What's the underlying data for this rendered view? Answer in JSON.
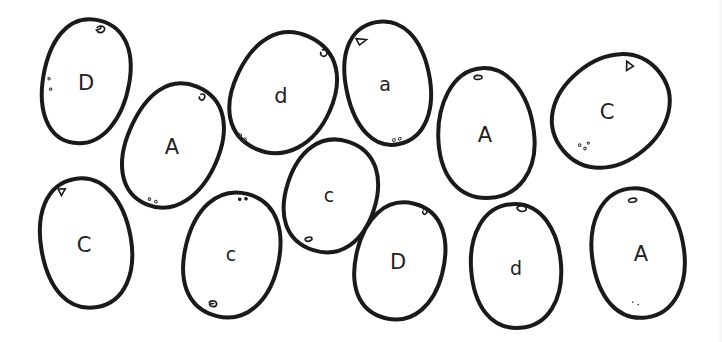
{
  "worksheet": {
    "title": "",
    "background_color": "#ffffff",
    "outline_color": "#1a1a1a",
    "potatoes": [
      {
        "letter": "D",
        "case": "upper",
        "cx": 86,
        "cy": 82,
        "rx": 43,
        "ry": 63,
        "rotate": 8
      },
      {
        "letter": "A",
        "case": "upper",
        "cx": 173,
        "cy": 146,
        "rx": 46,
        "ry": 64,
        "rotate": 22
      },
      {
        "letter": "d",
        "case": "lower",
        "cx": 283,
        "cy": 93,
        "rx": 50,
        "ry": 62,
        "rotate": 24
      },
      {
        "letter": "a",
        "case": "lower",
        "cx": 388,
        "cy": 83,
        "rx": 42,
        "ry": 62,
        "rotate": -12
      },
      {
        "letter": "A",
        "case": "upper",
        "cx": 486,
        "cy": 133,
        "rx": 48,
        "ry": 65,
        "rotate": -4
      },
      {
        "letter": "C",
        "case": "upper",
        "cx": 611,
        "cy": 111,
        "rx": 51,
        "ry": 62,
        "rotate": 50
      },
      {
        "letter": "C",
        "case": "upper",
        "cx": 86,
        "cy": 243,
        "rx": 45,
        "ry": 65,
        "rotate": -10
      },
      {
        "letter": "c",
        "case": "lower",
        "cx": 232,
        "cy": 255,
        "rx": 47,
        "ry": 63,
        "rotate": 14
      },
      {
        "letter": "c",
        "case": "lower",
        "cx": 331,
        "cy": 196,
        "rx": 45,
        "ry": 57,
        "rotate": 18
      },
      {
        "letter": "D",
        "case": "upper",
        "cx": 400,
        "cy": 261,
        "rx": 44,
        "ry": 59,
        "rotate": 14
      },
      {
        "letter": "d",
        "case": "lower",
        "cx": 516,
        "cy": 266,
        "rx": 45,
        "ry": 62,
        "rotate": -4
      },
      {
        "letter": "A",
        "case": "upper",
        "cx": 638,
        "cy": 253,
        "rx": 46,
        "ry": 65,
        "rotate": -8
      }
    ]
  }
}
